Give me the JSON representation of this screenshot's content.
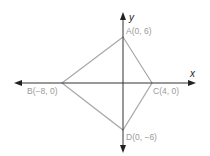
{
  "diagram": {
    "type": "coordinate-plane-quadrilateral",
    "axes": {
      "x_label": "x",
      "y_label": "y"
    },
    "points": [
      {
        "name": "A",
        "label": "A(0, 6)",
        "x": 0,
        "y": 6
      },
      {
        "name": "B",
        "label": "B(−8, 0)",
        "x": -8,
        "y": 0
      },
      {
        "name": "C",
        "label": "C(4, 0)",
        "x": 4,
        "y": 0
      },
      {
        "name": "D",
        "label": "D(0, −6)",
        "x": 0,
        "y": -6
      }
    ],
    "colors": {
      "axes": "#333333",
      "shape": "#a8a8a8",
      "labels": "#9a9a9a"
    }
  }
}
